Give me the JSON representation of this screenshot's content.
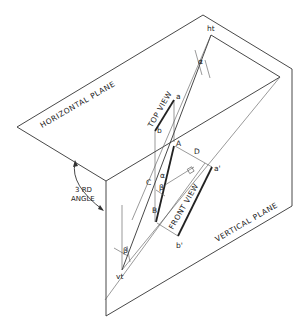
{
  "figure": {
    "type": "descriptive geometry projection diagram",
    "planes": {
      "horizontal": "HORIZONTAL PLANE",
      "vertical": "VERTICAL PLANE"
    },
    "views": {
      "top": "TOP VIEW",
      "front": "FRONT VIEW"
    },
    "angle_label": {
      "line1": "3 RD",
      "line2": "ANGLE"
    },
    "points": {
      "ht": "ht",
      "vt": "vt",
      "a": "a",
      "b": "b",
      "a_prime": "a'",
      "b_prime": "b'",
      "A": "A",
      "B": "B",
      "C": "C",
      "D": "D"
    },
    "angles": {
      "alpha": "α",
      "beta": "β"
    },
    "colors": {
      "line": "#333333",
      "background": "#ffffff"
    }
  }
}
